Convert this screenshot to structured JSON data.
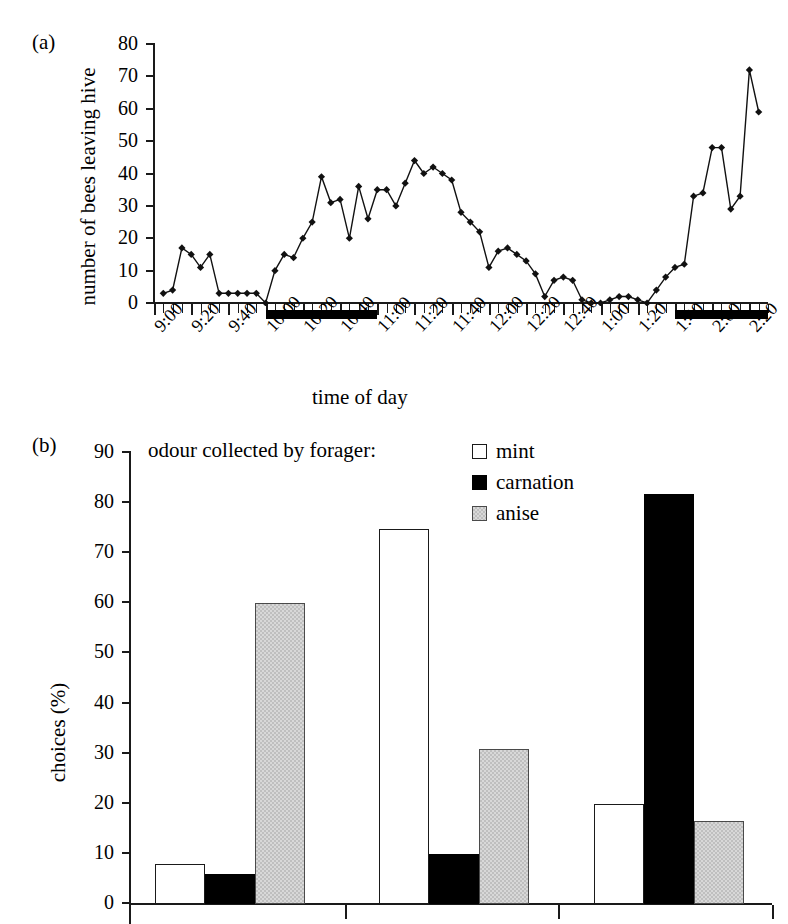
{
  "figure": {
    "panel_a_label": "(a)",
    "panel_b_label": "(b)"
  },
  "chart_data": [
    {
      "type": "line",
      "panel": "(a)",
      "title": "",
      "xlabel": "time of day",
      "ylabel": "number of bees leaving hive",
      "ylim": [
        0,
        80
      ],
      "yticks": [
        0,
        10,
        20,
        30,
        40,
        50,
        60,
        70,
        80
      ],
      "xtick_labels": [
        "9:00",
        "9:20",
        "9:40",
        "10:00",
        "10:20",
        "10:40",
        "11:00",
        "11:20",
        "11:40",
        "12:00",
        "12:20",
        "12:40",
        "1:00",
        "1:20",
        "1:40",
        "2:00",
        "2:20"
      ],
      "x_tick_interval_minutes": 5,
      "x_label_interval_minutes": 20,
      "grid": false,
      "legend": "none",
      "marker": "filled-diamond",
      "x": [
        "9:05",
        "9:10",
        "9:15",
        "9:20",
        "9:25",
        "9:30",
        "9:35",
        "9:40",
        "9:45",
        "9:50",
        "9:55",
        "10:00",
        "10:05",
        "10:10",
        "10:15",
        "10:20",
        "10:25",
        "10:30",
        "10:35",
        "10:40",
        "10:45",
        "10:50",
        "10:55",
        "11:00",
        "11:05",
        "11:10",
        "11:15",
        "11:20",
        "11:25",
        "11:30",
        "11:35",
        "11:40",
        "11:45",
        "11:50",
        "11:55",
        "12:00",
        "12:05",
        "12:10",
        "12:15",
        "12:20",
        "12:25",
        "12:30",
        "12:35",
        "12:40",
        "12:45",
        "12:50",
        "12:55",
        "1:00",
        "1:05",
        "1:10",
        "1:15",
        "1:20",
        "1:25",
        "1:30",
        "1:35",
        "1:40",
        "1:45",
        "1:50",
        "1:55",
        "2:00",
        "2:05",
        "2:10",
        "2:15",
        "2:20",
        "2:25"
      ],
      "values": [
        3,
        4,
        17,
        15,
        11,
        15,
        3,
        3,
        3,
        3,
        3,
        0,
        10,
        15,
        14,
        20,
        25,
        39,
        31,
        32,
        20,
        36,
        26,
        35,
        35,
        30,
        37,
        44,
        40,
        42,
        40,
        38,
        28,
        25,
        22,
        11,
        16,
        17,
        15,
        13,
        9,
        2,
        7,
        8,
        7,
        1,
        0,
        0,
        1,
        2,
        2,
        1,
        0,
        4,
        8,
        11,
        12,
        33,
        34,
        48,
        48,
        29,
        33,
        72,
        59
      ],
      "odour_periods": [
        {
          "start": "10:00",
          "end": "11:00",
          "style": "black-bar"
        },
        {
          "start": "1:40",
          "end": "2:30",
          "style": "black-bar"
        }
      ]
    },
    {
      "type": "bar",
      "panel": "(b)",
      "title": "odour collected by forager:",
      "xlabel": "",
      "ylabel": "choices (%)",
      "ylim": [
        0,
        90
      ],
      "yticks": [
        0,
        10,
        20,
        30,
        40,
        50,
        60,
        70,
        80,
        90
      ],
      "grid": false,
      "legend_position": "top-right",
      "categories": [
        "group 1",
        "group 2",
        "group 3"
      ],
      "series": [
        {
          "name": "mint",
          "color": "#ffffff",
          "values": [
            8,
            74.8,
            19.9
          ]
        },
        {
          "name": "carnation",
          "color": "#000000",
          "values": [
            5.9,
            9.9,
            81.8
          ]
        },
        {
          "name": "anise",
          "color": "#d8d8d8",
          "values": [
            60,
            31,
            16.6
          ]
        }
      ]
    }
  ]
}
